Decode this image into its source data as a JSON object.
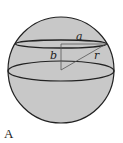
{
  "figure": {
    "caption": "A",
    "labels": {
      "a": "a",
      "b": "b",
      "r": "r"
    },
    "colors": {
      "sphere_fill": "#c8c8c8",
      "stroke": "#222222",
      "background": "#ffffff"
    }
  }
}
